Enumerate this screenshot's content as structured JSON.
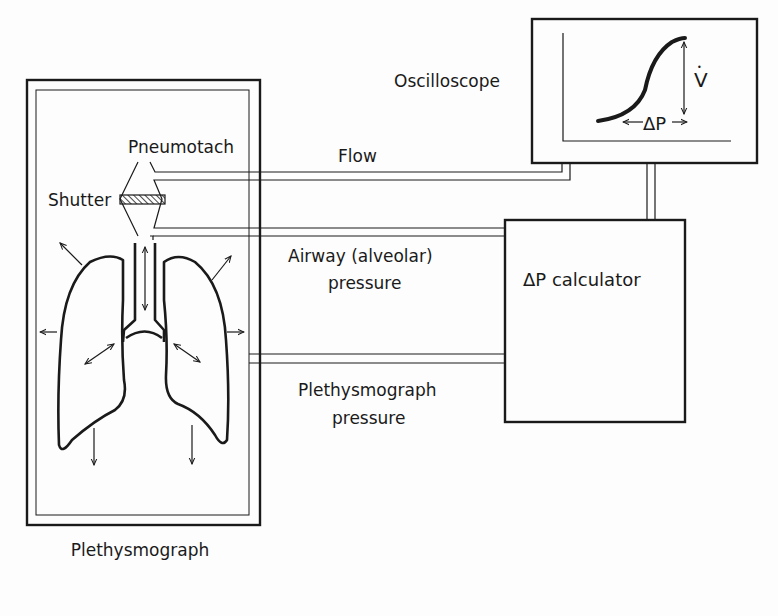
{
  "diagram": {
    "colors": {
      "ink": "#1a1a1a",
      "paper": "#fdfdfd"
    },
    "labels": {
      "plethysmograph": "Plethysmograph",
      "pneumotach": "Pneumotach",
      "shutter": "Shutter",
      "oscilloscope": "Oscilloscope",
      "flow": "Flow",
      "airway_line1": "Airway (alveolar)",
      "airway_line2": "pressure",
      "pleth_line1": "Plethysmograph",
      "pleth_line2": "pressure",
      "calculator": "ΔP calculator",
      "scope_v": "V",
      "scope_v_dot": "•",
      "scope_dp": "ΔP"
    },
    "components": [
      {
        "id": "plethysmograph",
        "kind": "enclosure"
      },
      {
        "id": "pneumotach",
        "kind": "sensor"
      },
      {
        "id": "shutter",
        "kind": "valve"
      },
      {
        "id": "lungs",
        "kind": "anatomy"
      },
      {
        "id": "oscilloscope",
        "kind": "display"
      },
      {
        "id": "dp-calculator",
        "kind": "processor"
      }
    ],
    "connections": [
      {
        "from": "pneumotach",
        "to": "oscilloscope",
        "label": "Flow"
      },
      {
        "from": "pneumotach",
        "to": "dp-calculator",
        "label": "Airway (alveolar) pressure"
      },
      {
        "from": "plethysmograph",
        "to": "dp-calculator",
        "label": "Plethysmograph pressure"
      },
      {
        "from": "dp-calculator",
        "to": "oscilloscope",
        "label": ""
      }
    ]
  }
}
